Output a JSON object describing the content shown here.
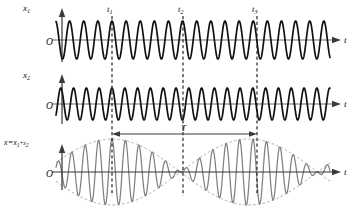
{
  "figure": {
    "title_caption": "",
    "background_color": "#ffffff",
    "width": 360,
    "height": 215
  },
  "panels": [
    {
      "id": "panel-x1",
      "y_axis_label": "x",
      "y_axis_subscript": "1",
      "origin_label": "O",
      "t_axis_label": "t",
      "wave_color": "#111111",
      "baseline_y": 40,
      "amplitude": 19,
      "cycles": 19.4,
      "phase_deg": 0
    },
    {
      "id": "panel-x2",
      "y_axis_label": "x",
      "y_axis_subscript": "2",
      "origin_label": "O",
      "t_axis_label": "t",
      "wave_color": "#111111",
      "baseline_y": 104,
      "amplitude": 16,
      "cycles": 21.4,
      "phase_deg": 0
    },
    {
      "id": "panel-sum",
      "y_axis_label": "x=x",
      "y_axis_subscript_1": "1",
      "y_axis_plus": "+x",
      "y_axis_subscript_2": "2",
      "origin_label": "O",
      "t_axis_label": "t",
      "wave_color": "#808080",
      "envelope_color": "#9a9a9a",
      "baseline_y": 172,
      "amplitude": 33,
      "phase_deg": 0
    }
  ],
  "markers": [
    {
      "label": "t",
      "subscript": "1",
      "x": 112,
      "name": "marker-t1"
    },
    {
      "label": "t",
      "subscript": "2",
      "x": 183,
      "name": "marker-t2"
    },
    {
      "label": "t",
      "subscript": "3",
      "x": 257,
      "name": "marker-t3"
    }
  ],
  "period_annotation": {
    "label": "T",
    "from_x": 112,
    "to_x": 257,
    "y": 134
  },
  "chart_data": {
    "type": "line",
    "xlabel": "t",
    "ylabel": "x",
    "grid": false,
    "legend": "none",
    "series": [
      {
        "name": "x1",
        "description": "First harmonic oscillation, lower frequency",
        "cycles_shown": 19.4,
        "amplitude": 1.0,
        "panel": "panel-x1"
      },
      {
        "name": "x2",
        "description": "Second harmonic oscillation, slightly higher frequency",
        "cycles_shown": 21.4,
        "amplitude": 1.0,
        "panel": "panel-x2"
      },
      {
        "name": "x=x1+x2",
        "description": "Superposition showing beats; envelope maxima at t1 and t3, node at t2",
        "amplitude": 2.0,
        "beat_period_label": "T",
        "panel": "panel-sum"
      }
    ],
    "annotations": [
      {
        "text": "t1",
        "type": "time-marker",
        "x": 112
      },
      {
        "text": "t2",
        "type": "time-marker",
        "x": 183
      },
      {
        "text": "t3",
        "type": "time-marker",
        "x": 257
      },
      {
        "text": "T",
        "type": "beat-period",
        "from": 112,
        "to": 257
      }
    ]
  }
}
